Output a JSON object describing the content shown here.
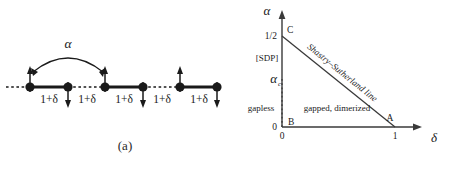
{
  "figure": {
    "panel_a": {
      "caption": "(a)",
      "coupling_label": "α",
      "bond_labels": [
        "1+δ",
        "1+δ",
        "1+δ",
        "1+δ",
        "1+δ"
      ],
      "sites": [
        {
          "x": 30,
          "spin": "up"
        },
        {
          "x": 68,
          "spin": "down"
        },
        {
          "x": 105,
          "spin": "up"
        },
        {
          "x": 143,
          "spin": "down"
        },
        {
          "x": 180,
          "spin": "up"
        },
        {
          "x": 217,
          "spin": "down"
        }
      ],
      "bonds": [
        {
          "from": 0,
          "to": 1,
          "style": "solid"
        },
        {
          "from": 1,
          "to": 2,
          "style": "dotted"
        },
        {
          "from": 2,
          "to": 3,
          "style": "solid"
        },
        {
          "from": 3,
          "to": 4,
          "style": "dotted"
        },
        {
          "from": 4,
          "to": 5,
          "style": "solid"
        }
      ],
      "arc": {
        "from_site": 0,
        "to_site": 2,
        "label": "α"
      }
    },
    "panel_b": {
      "caption": "(b)",
      "y_axis_label": "α",
      "x_axis_label": "δ",
      "y_ticks": [
        {
          "value": "1/2",
          "label": "1/2"
        },
        {
          "value": "alpha_c",
          "label": "α"
        },
        {
          "value": "0",
          "label": "0"
        }
      ],
      "y_tick_sub": "c",
      "x_ticks": [
        {
          "value": "0",
          "label": "0"
        },
        {
          "value": "1",
          "label": "1"
        }
      ],
      "points": [
        {
          "name": "A",
          "label": "A"
        },
        {
          "name": "B",
          "label": "B"
        },
        {
          "name": "C",
          "label": "C"
        }
      ],
      "phase_line_label": "Shastry–Sutherland line",
      "regions": [
        {
          "name": "sdp",
          "label": "[SDP]"
        },
        {
          "name": "gapless",
          "label": "gapless"
        },
        {
          "name": "gapped",
          "label": "gapped, dimerized"
        }
      ]
    }
  },
  "colors": {
    "ink": "#1a1a1a",
    "background": "#ffffff",
    "line": "#3a3a3a"
  }
}
